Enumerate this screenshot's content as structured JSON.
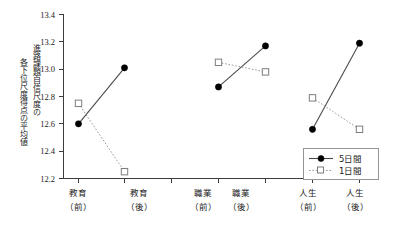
{
  "chart_data": {
    "type": "line",
    "title": "",
    "xlabel": "",
    "ylabel": "進路課題自信尺度の各下位尺度得点の平均値",
    "ylabel_line1": "進路課題自信尺度の",
    "ylabel_line2": "各下位尺度得点の平均値",
    "categories": [
      "教育（前）",
      "教育（後）",
      "職業（前）",
      "職業（後）",
      "人生（前）",
      "人生（後）"
    ],
    "categories_main": [
      "教育",
      "教育",
      "職業",
      "職業",
      "人生",
      "人生"
    ],
    "categories_sub": [
      "（前）",
      "（後）",
      "（前）",
      "（後）",
      "（前）",
      "（後）"
    ],
    "series": [
      {
        "name": "5日間",
        "marker": "filled-circle",
        "line": "solid",
        "color": "#000000",
        "values": [
          12.6,
          13.01,
          12.87,
          13.17,
          12.56,
          13.19
        ]
      },
      {
        "name": "1日間",
        "marker": "open-square",
        "line": "dotted",
        "color": "#8a8a8a",
        "values": [
          12.75,
          12.25,
          13.05,
          12.98,
          12.79,
          12.56
        ]
      }
    ],
    "segments": [
      [
        0,
        1
      ],
      [
        2,
        3
      ],
      [
        4,
        5
      ]
    ],
    "ylim": [
      12.2,
      13.4
    ],
    "yticks": [
      12.2,
      12.4,
      12.6,
      12.8,
      13.0,
      13.2,
      13.4
    ],
    "ytick_labels": [
      "12.2",
      "12.4",
      "12.6",
      "12.8",
      "13.0",
      "13.2",
      "13.4"
    ],
    "grid": false,
    "legend_position": "bottom-right",
    "legend_entries": [
      {
        "label": "5日間",
        "marker": "filled-circle",
        "line": "solid"
      },
      {
        "label": "1日間",
        "marker": "open-square",
        "line": "dotted"
      }
    ]
  }
}
